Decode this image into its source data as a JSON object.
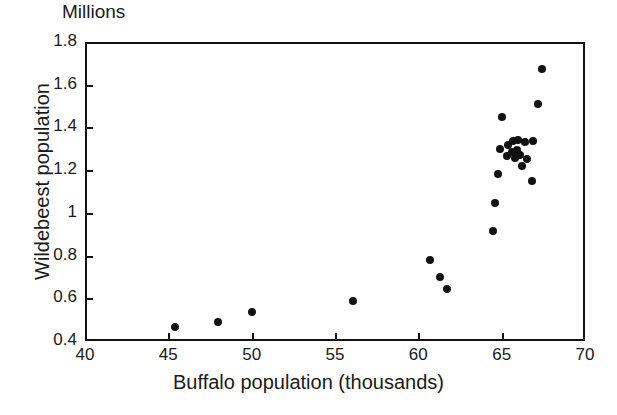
{
  "chart_data": {
    "type": "scatter",
    "title": "",
    "units_caption": "Millions",
    "xlabel": "Buffalo population (thousands)",
    "ylabel": "Wildebeest population",
    "xlim": [
      40,
      70
    ],
    "ylim": [
      0.4,
      1.8
    ],
    "xticks": [
      40,
      45,
      50,
      55,
      60,
      65,
      70
    ],
    "xtick_labels": [
      "40",
      "45",
      "50",
      "55",
      "60",
      "65",
      "70"
    ],
    "yticks": [
      0.4,
      0.6,
      0.8,
      1.0,
      1.2,
      1.4,
      1.6,
      1.8
    ],
    "ytick_labels": [
      "0.4",
      "0.6",
      "0.8",
      "1",
      "1.2",
      "1.4",
      "1.6",
      "1.8"
    ],
    "grid": false,
    "legend": null,
    "marker": "filled-circle",
    "marker_color": "#111111",
    "marker_size_px": 8,
    "points": [
      {
        "x": 45.4,
        "y": 0.465
      },
      {
        "x": 48.0,
        "y": 0.487
      },
      {
        "x": 50.0,
        "y": 0.535
      },
      {
        "x": 56.1,
        "y": 0.588
      },
      {
        "x": 60.7,
        "y": 0.777
      },
      {
        "x": 61.3,
        "y": 0.7
      },
      {
        "x": 61.7,
        "y": 0.645
      },
      {
        "x": 64.5,
        "y": 0.913
      },
      {
        "x": 64.6,
        "y": 1.048
      },
      {
        "x": 64.8,
        "y": 1.182
      },
      {
        "x": 65.0,
        "y": 1.447
      },
      {
        "x": 64.9,
        "y": 1.3
      },
      {
        "x": 65.3,
        "y": 1.265
      },
      {
        "x": 65.4,
        "y": 1.318
      },
      {
        "x": 65.6,
        "y": 1.285
      },
      {
        "x": 65.7,
        "y": 1.335
      },
      {
        "x": 65.8,
        "y": 1.258
      },
      {
        "x": 65.9,
        "y": 1.295
      },
      {
        "x": 66.0,
        "y": 1.34
      },
      {
        "x": 66.1,
        "y": 1.272
      },
      {
        "x": 66.2,
        "y": 1.218
      },
      {
        "x": 66.4,
        "y": 1.33
      },
      {
        "x": 66.5,
        "y": 1.252
      },
      {
        "x": 66.9,
        "y": 1.335
      },
      {
        "x": 66.8,
        "y": 1.15
      },
      {
        "x": 67.2,
        "y": 1.51
      },
      {
        "x": 67.4,
        "y": 1.672
      }
    ]
  },
  "axes": {
    "frame_color": "#111111",
    "background": "#ffffff"
  }
}
